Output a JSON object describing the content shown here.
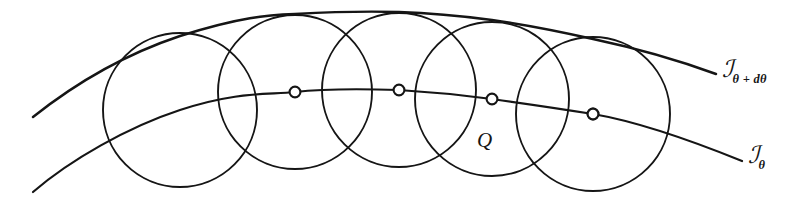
{
  "figure": {
    "background_color": "#ffffff",
    "ink_color": "#151515",
    "width": 798,
    "height": 207
  },
  "labels": {
    "upper_curve": {
      "symbol": "ℐ",
      "subscript": "θ + dθ"
    },
    "lower_curve": {
      "symbol": "ℐ",
      "subscript": "θ"
    },
    "point_q": "Q"
  },
  "geometry": {
    "circle_radius": 77,
    "circles": [
      {
        "cx": 180,
        "cy": 110,
        "r": 77
      },
      {
        "cx": 295,
        "cy": 92,
        "r": 77
      },
      {
        "cx": 399,
        "cy": 90,
        "r": 77
      },
      {
        "cx": 492,
        "cy": 99,
        "r": 77
      },
      {
        "cx": 593,
        "cy": 114,
        "r": 77
      }
    ],
    "center_markers": [
      {
        "cx": 180,
        "cy": 110,
        "r": 5.4
      },
      {
        "cx": 295,
        "cy": 92,
        "r": 5.4
      },
      {
        "cx": 399,
        "cy": 90,
        "r": 5.4
      },
      {
        "cx": 492,
        "cy": 99,
        "r": 5.4
      },
      {
        "cx": 593,
        "cy": 114,
        "r": 5.4
      }
    ],
    "lower_curve_path": "M 33 192 C 70 160 128 127 180 110 C 238 91 268 95 295 92 C 330 88 368 89 399 90 C 432 92 462 95 492 99 C 528 104 562 109 593 114 C 640 122 700 144 742 161",
    "upper_curve_path": "M 33 117 C 72 86 120 56 180 36 C 240 17 268 15 295 14 C 330 12 368 11 399 12 C 432 13 462 16 492 20 C 528 25 562 32 593 39 C 640 49 686 63 716 74"
  }
}
